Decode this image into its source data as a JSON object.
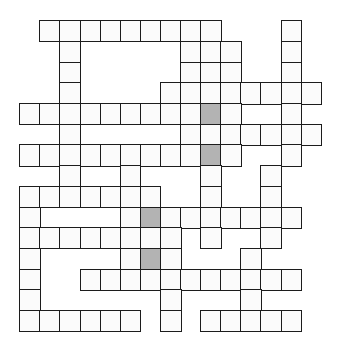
{
  "puzzle": {
    "type": "crossword",
    "cols": 15,
    "rows": 15,
    "origin": {
      "x": 20,
      "y": 21
    },
    "cell_size": {
      "w": 20.1,
      "h": 20.7
    },
    "colors": {
      "border": "#1c1c1c",
      "cell": "#fbfbfb",
      "shaded": "#b3b3b3",
      "background": "#ffffff"
    },
    "grid": [
      {
        "row": 0,
        "cells": [
          1,
          2,
          3,
          4,
          5,
          6,
          7,
          8,
          9,
          13
        ]
      },
      {
        "row": 1,
        "cells": [
          2,
          8,
          9,
          10,
          13
        ]
      },
      {
        "row": 2,
        "cells": [
          2,
          8,
          9,
          10,
          13
        ]
      },
      {
        "row": 3,
        "cells": [
          2,
          7,
          8,
          9,
          10,
          11,
          12,
          13,
          14
        ]
      },
      {
        "row": 4,
        "cells": [
          0,
          1,
          2,
          3,
          4,
          5,
          6,
          7,
          8,
          9,
          10,
          13
        ]
      },
      {
        "row": 5,
        "cells": [
          2,
          8,
          9,
          10,
          11,
          12,
          13,
          14
        ]
      },
      {
        "row": 6,
        "cells": [
          0,
          1,
          2,
          3,
          4,
          5,
          6,
          7,
          8,
          9,
          10,
          13
        ]
      },
      {
        "row": 7,
        "cells": [
          2,
          5,
          9,
          12
        ]
      },
      {
        "row": 8,
        "cells": [
          0,
          1,
          2,
          3,
          4,
          5,
          6,
          9,
          12
        ]
      },
      {
        "row": 9,
        "cells": [
          0,
          5,
          6,
          7,
          8,
          9,
          10,
          11,
          12,
          13
        ]
      },
      {
        "row": 10,
        "cells": [
          0,
          1,
          2,
          3,
          4,
          5,
          6,
          7,
          9,
          12
        ]
      },
      {
        "row": 11,
        "cells": [
          0,
          5,
          6,
          7,
          11
        ]
      },
      {
        "row": 12,
        "cells": [
          0,
          3,
          4,
          5,
          6,
          7,
          8,
          9,
          10,
          11,
          12,
          13
        ]
      },
      {
        "row": 13,
        "cells": [
          0,
          7,
          11
        ]
      },
      {
        "row": 14,
        "cells": [
          0,
          1,
          2,
          3,
          4,
          5,
          7,
          9,
          10,
          11,
          12,
          13
        ]
      }
    ],
    "shaded": [
      {
        "row": 4,
        "col": 9
      },
      {
        "row": 6,
        "col": 9
      },
      {
        "row": 9,
        "col": 6
      },
      {
        "row": 11,
        "col": 6
      }
    ],
    "entries": {}
  }
}
